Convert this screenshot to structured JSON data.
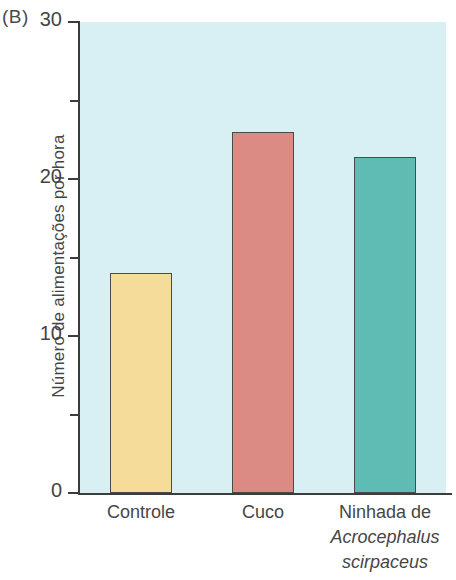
{
  "panel": {
    "label": "(B)"
  },
  "chart_data": {
    "type": "bar",
    "title": "",
    "xlabel": "",
    "ylabel": "Número de alimentações  por hora",
    "categories": [
      "Controle",
      "Cuco",
      "Ninhada de Acrocephalus scirpaceus"
    ],
    "category_lines": [
      [
        "Controle"
      ],
      [
        "Cuco"
      ],
      [
        "Ninhada de",
        "Acrocephalus",
        "scirpaceus"
      ]
    ],
    "values": [
      14.0,
      23.0,
      21.4
    ],
    "ylim": [
      0,
      30
    ],
    "ytick_major": [
      0,
      10,
      20,
      30
    ],
    "ytick_minor": [
      5,
      15,
      25
    ],
    "ytick_labels": [
      "0",
      "10",
      "20",
      "30"
    ],
    "grid": false,
    "legend": "none",
    "plot_background": "#d8f0f3",
    "bar_colors": [
      "#f5dc9b",
      "#db8a84",
      "#5fbcb5"
    ],
    "bar_border_color": "#4a4a4a",
    "axis_color": "#3c3c3c"
  }
}
